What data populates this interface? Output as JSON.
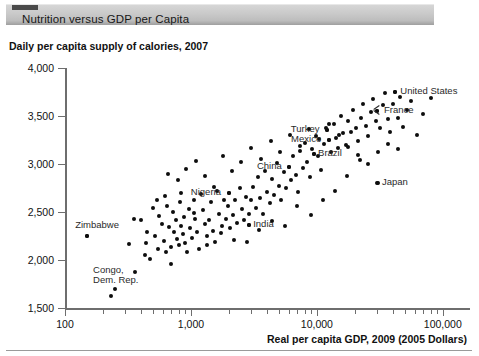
{
  "header": {
    "title": "Nutrition versus GDP per Capita",
    "tab_nub": "tab-marker"
  },
  "chart_data": {
    "type": "scatter",
    "title": "Daily per capita supply of calories, 2007",
    "xlabel": "Real per capita GDP, 2009 (2005 Dollars)",
    "ylabel": "",
    "xscale": "log",
    "yscale": "linear",
    "xlim": [
      100,
      150000
    ],
    "ylim": [
      1500,
      4000
    ],
    "grid": false,
    "legend": null,
    "x_ticks_major": [
      100,
      1000,
      10000,
      100000
    ],
    "x_tick_labels": [
      "100",
      "1,000",
      "10,000",
      "100,000"
    ],
    "y_ticks": [
      1500,
      2000,
      2500,
      3000,
      3500,
      4000
    ],
    "y_tick_labels": [
      "1,500",
      "2,000",
      "2,500",
      "3,000",
      "3,500",
      "4,000"
    ],
    "annotations": [
      {
        "label": "United States",
        "x": 42000,
        "y": 3750,
        "anchor": "right"
      },
      {
        "label": "France",
        "x": 30000,
        "y": 3550,
        "anchor": "right"
      },
      {
        "label": "Turkey",
        "x": 12000,
        "y": 3350,
        "anchor": "left"
      },
      {
        "label": "Mexico",
        "x": 12500,
        "y": 3250,
        "anchor": "left"
      },
      {
        "label": "Brazil",
        "x": 9500,
        "y": 3100,
        "anchor": "left"
      },
      {
        "label": "China",
        "x": 6000,
        "y": 2970,
        "anchor": "left"
      },
      {
        "label": "Japan",
        "x": 30000,
        "y": 2800,
        "anchor": "left"
      },
      {
        "label": "Nigeria",
        "x": 2000,
        "y": 2700,
        "anchor": "left"
      },
      {
        "label": "India",
        "x": 2900,
        "y": 2360,
        "anchor": "left"
      },
      {
        "label": "Zimbabwe",
        "x": 150,
        "y": 2250,
        "anchor": "left"
      },
      {
        "label": "Congo, Dem. Rep.",
        "x": 250,
        "y": 1700,
        "anchor": "left"
      }
    ],
    "points": [
      [
        150,
        2250
      ],
      [
        230,
        1620
      ],
      [
        320,
        2170
      ],
      [
        360,
        1870
      ],
      [
        400,
        2420
      ],
      [
        430,
        2050
      ],
      [
        450,
        2290
      ],
      [
        470,
        2010
      ],
      [
        500,
        2540
      ],
      [
        520,
        2250
      ],
      [
        545,
        2110
      ],
      [
        560,
        2460
      ],
      [
        590,
        2380
      ],
      [
        610,
        2200
      ],
      [
        630,
        2080
      ],
      [
        650,
        2560
      ],
      [
        670,
        2340
      ],
      [
        690,
        2140
      ],
      [
        700,
        1960
      ],
      [
        720,
        2500
      ],
      [
        740,
        2290
      ],
      [
        760,
        2420
      ],
      [
        780,
        2220
      ],
      [
        800,
        2160
      ],
      [
        820,
        2600
      ],
      [
        840,
        2350
      ],
      [
        860,
        2270
      ],
      [
        880,
        2450
      ],
      [
        900,
        2180
      ],
      [
        930,
        2080
      ],
      [
        960,
        2530
      ],
      [
        990,
        2330
      ],
      [
        1020,
        2230
      ],
      [
        1050,
        2620
      ],
      [
        1080,
        2430
      ],
      [
        1110,
        2290
      ],
      [
        1150,
        2110
      ],
      [
        1200,
        2690
      ],
      [
        1250,
        2520
      ],
      [
        1300,
        2370
      ],
      [
        1350,
        2250
      ],
      [
        1400,
        2420
      ],
      [
        1450,
        2600
      ],
      [
        1500,
        2300
      ],
      [
        1560,
        2190
      ],
      [
        1620,
        2720
      ],
      [
        1680,
        2480
      ],
      [
        1750,
        2350
      ],
      [
        1820,
        2630
      ],
      [
        1900,
        2430
      ],
      [
        1980,
        2560
      ],
      [
        2000,
        2700
      ],
      [
        2060,
        2330
      ],
      [
        2150,
        2470
      ],
      [
        2240,
        2620
      ],
      [
        2330,
        2390
      ],
      [
        2430,
        2750
      ],
      [
        2530,
        2530
      ],
      [
        2640,
        2420
      ],
      [
        2750,
        2660
      ],
      [
        2870,
        2480
      ],
      [
        2900,
        2360
      ],
      [
        3000,
        2620
      ],
      [
        3130,
        2760
      ],
      [
        3270,
        2540
      ],
      [
        3410,
        2860
      ],
      [
        3560,
        2650
      ],
      [
        3710,
        2480
      ],
      [
        3870,
        2930
      ],
      [
        4040,
        2710
      ],
      [
        4220,
        2590
      ],
      [
        4400,
        2840
      ],
      [
        4600,
        2680
      ],
      [
        4800,
        3010
      ],
      [
        5000,
        2770
      ],
      [
        5220,
        2620
      ],
      [
        5450,
        2920
      ],
      [
        5700,
        2750
      ],
      [
        6000,
        2970
      ],
      [
        6200,
        2830
      ],
      [
        6500,
        3080
      ],
      [
        6800,
        2890
      ],
      [
        7100,
        2710
      ],
      [
        7400,
        3140
      ],
      [
        7700,
        2960
      ],
      [
        8000,
        3220
      ],
      [
        8400,
        3020
      ],
      [
        8800,
        2860
      ],
      [
        9200,
        3160
      ],
      [
        9500,
        3100
      ],
      [
        9900,
        3290
      ],
      [
        10300,
        3080
      ],
      [
        10800,
        2940
      ],
      [
        11300,
        3210
      ],
      [
        11800,
        3380
      ],
      [
        12000,
        3350
      ],
      [
        12500,
        3250
      ],
      [
        13000,
        3120
      ],
      [
        13600,
        3420
      ],
      [
        14200,
        3270
      ],
      [
        14800,
        3170
      ],
      [
        15500,
        3500
      ],
      [
        16200,
        3320
      ],
      [
        17000,
        3200
      ],
      [
        17800,
        3450
      ],
      [
        18600,
        3330
      ],
      [
        19500,
        3560
      ],
      [
        20400,
        3380
      ],
      [
        21400,
        3240
      ],
      [
        22400,
        3480
      ],
      [
        23400,
        3620
      ],
      [
        24500,
        3400
      ],
      [
        25600,
        3290
      ],
      [
        26800,
        3540
      ],
      [
        28000,
        3680
      ],
      [
        29300,
        3450
      ],
      [
        30000,
        3550
      ],
      [
        30500,
        2800
      ],
      [
        31900,
        3380
      ],
      [
        33400,
        3610
      ],
      [
        35000,
        3740
      ],
      [
        36600,
        3470
      ],
      [
        38300,
        3330
      ],
      [
        40100,
        3620
      ],
      [
        42000,
        3750
      ],
      [
        44000,
        3480
      ],
      [
        46000,
        3700
      ],
      [
        48500,
        3390
      ],
      [
        52000,
        3560
      ],
      [
        56000,
        3660
      ],
      [
        62000,
        3300
      ],
      [
        70000,
        3520
      ],
      [
        80000,
        3690
      ],
      [
        620,
        2670
      ],
      [
        830,
        2700
      ],
      [
        1060,
        2490
      ],
      [
        1340,
        2160
      ],
      [
        1740,
        2280
      ],
      [
        2210,
        2210
      ],
      [
        2780,
        2190
      ],
      [
        3500,
        2310
      ],
      [
        4400,
        2410
      ],
      [
        5600,
        2350
      ],
      [
        7000,
        2560
      ],
      [
        8900,
        2470
      ],
      [
        11200,
        2630
      ],
      [
        14000,
        2720
      ],
      [
        17500,
        2880
      ],
      [
        22000,
        3040
      ],
      [
        350,
        2430
      ],
      [
        440,
        2180
      ],
      [
        540,
        2620
      ],
      [
        660,
        2900
      ],
      [
        790,
        2830
      ],
      [
        920,
        2950
      ],
      [
        1100,
        3030
      ],
      [
        1290,
        2870
      ],
      [
        1530,
        2760
      ],
      [
        1800,
        3080
      ],
      [
        2100,
        2930
      ],
      [
        2500,
        3020
      ],
      [
        3000,
        3170
      ],
      [
        3600,
        3050
      ],
      [
        4300,
        3240
      ],
      [
        5100,
        3120
      ],
      [
        6100,
        3300
      ],
      [
        7300,
        3190
      ],
      [
        8700,
        3360
      ],
      [
        10400,
        3260
      ],
      [
        12400,
        3420
      ],
      [
        14900,
        3300
      ],
      [
        17800,
        3180
      ],
      [
        21300,
        3090
      ],
      [
        25500,
        3000
      ],
      [
        30500,
        3120
      ],
      [
        36500,
        3210
      ],
      [
        43700,
        3160
      ]
    ]
  }
}
